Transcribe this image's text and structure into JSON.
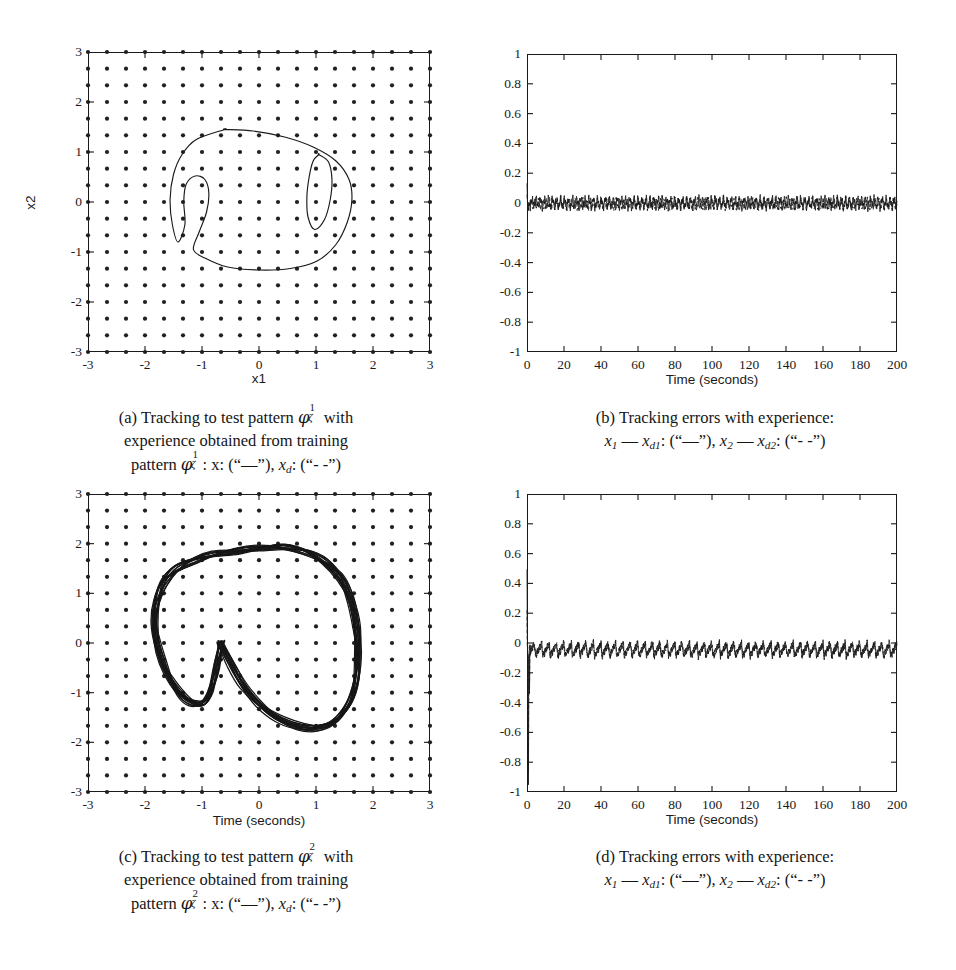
{
  "panels": [
    {
      "id": "a",
      "tag": "(a)",
      "caption_lines": [
        "(a) Tracking to test pattern φ¹_ζ with",
        "experience obtained from training",
        "pattern φ¹_ζ: x: (“—”), x_d: (“- -”)"
      ],
      "caption_plain": "(a) Tracking to test pattern φζ¹ with experience obtained from training pattern φζ¹: x: (“—”), xd: (“- -”)",
      "xlabel": "x1",
      "ylabel": "x2",
      "xticks": [
        "-3",
        "-2",
        "-1",
        "0",
        "1",
        "2",
        "3"
      ],
      "yticks": [
        "3",
        "2",
        "1",
        "0",
        "-1",
        "-2",
        "-3"
      ]
    },
    {
      "id": "b",
      "tag": "(b)",
      "caption_plain": "(b) Tracking errors with experience: x1 — xd1: (“—”), x2 — xd2: (“- -”)",
      "xlabel": "Time (seconds)",
      "ylabel": "",
      "xticks": [
        "0",
        "20",
        "40",
        "60",
        "80",
        "100",
        "120",
        "140",
        "160",
        "180",
        "200"
      ],
      "yticks": [
        "1",
        "0.8",
        "0.6",
        "0.4",
        "0.2",
        "0",
        "-0.2",
        "-0.4",
        "-0.6",
        "-0.8",
        "-1"
      ]
    },
    {
      "id": "c",
      "tag": "(c)",
      "caption_plain": "(c) Tracking to test pattern φζ² with experience obtained from training pattern φζ²: x: (“—”), xd: (“- -”)",
      "xlabel": "Time (seconds)",
      "ylabel": "",
      "xticks": [
        "-3",
        "-2",
        "-1",
        "0",
        "1",
        "2",
        "3"
      ],
      "yticks": [
        "3",
        "2",
        "1",
        "0",
        "-1",
        "-2",
        "-3"
      ]
    },
    {
      "id": "d",
      "tag": "(d)",
      "caption_plain": "(d) Tracking errors with experience: x1 — xd1: (“—”), x2 — xd2: (“- -”)",
      "xlabel": "Time (seconds)",
      "ylabel": "",
      "xticks": [
        "0",
        "20",
        "40",
        "60",
        "80",
        "100",
        "120",
        "140",
        "160",
        "180",
        "200"
      ],
      "yticks": [
        "1",
        "0.8",
        "0.6",
        "0.4",
        "0.2",
        "0",
        "-0.2",
        "-0.4",
        "-0.6",
        "-0.8",
        "-1"
      ]
    }
  ],
  "caption_text": {
    "a_l1_pre": "(a) Tracking to test pattern ",
    "a_l1_post": " with",
    "a_l2": "experience obtained from training",
    "a_l3_pre": "pattern ",
    "b_l1": "(b) Tracking errors with experience:",
    "c_l1_pre": "(c) Tracking to test pattern ",
    "c_l1_post": " with",
    "c_l2": "experience obtained from training",
    "c_l3_pre": "pattern ",
    "d_l1": "(d) Tracking errors with experience:",
    "phi": "φ",
    "zeta": "ζ",
    "sup1": "1",
    "sup2": "2",
    "colon_x": ": x: (“",
    "solid_glyph": "—",
    "close_quote": "”), ",
    "xd": "x",
    "d_sub": "d",
    "colon2": ": (“",
    "dashed_glyph": "- -",
    "final_close": "”)",
    "err_x": "x",
    "err_sub1": "1",
    "err_sub2": "2",
    "err_minus": "—",
    "err_xd": "x",
    "err_d1": "d1",
    "err_d2": "d2"
  },
  "chart_data": [
    {
      "id": "a",
      "type": "line",
      "title": "",
      "xlabel": "x1",
      "ylabel": "x2",
      "xlim": [
        -3,
        3
      ],
      "ylim": [
        -3,
        3
      ],
      "xticks": [
        -3,
        -2,
        -1,
        0,
        1,
        2,
        3
      ],
      "yticks": [
        -3,
        -2,
        -1,
        0,
        1,
        2,
        3
      ],
      "grid": "dot-lattice",
      "grid_note": "19x19 lattice of filled black dots covering the full axes box, spacing 1/3 unit",
      "series": [
        {
          "name": "x (“—”) actual state trajectory",
          "style": "solid",
          "closed": true,
          "points": [
            [
              -0.6,
              1.45
            ],
            [
              -0.1,
              1.42
            ],
            [
              0.45,
              1.3
            ],
            [
              0.95,
              1.1
            ],
            [
              1.35,
              0.82
            ],
            [
              1.58,
              0.45
            ],
            [
              1.63,
              0.05
            ],
            [
              1.55,
              -0.4
            ],
            [
              1.35,
              -0.85
            ],
            [
              1.02,
              -1.18
            ],
            [
              0.55,
              -1.33
            ],
            [
              0.0,
              -1.36
            ],
            [
              -0.55,
              -1.3
            ],
            [
              -0.95,
              -1.12
            ],
            [
              -1.15,
              -0.95
            ],
            [
              -1.05,
              -0.6
            ],
            [
              -0.92,
              -0.2
            ],
            [
              -0.88,
              0.18
            ],
            [
              -0.95,
              0.45
            ],
            [
              -1.12,
              0.52
            ],
            [
              -1.28,
              0.35
            ],
            [
              -1.32,
              0.0
            ],
            [
              -1.3,
              -0.45
            ],
            [
              -1.42,
              -0.8
            ],
            [
              -1.52,
              -0.45
            ],
            [
              -1.56,
              0.05
            ],
            [
              -1.5,
              0.55
            ],
            [
              -1.35,
              0.95
            ],
            [
              -1.1,
              1.25
            ],
            [
              -0.6,
              1.45
            ]
          ]
        },
        {
          "name": "inner loop right (part of same trajectory)",
          "style": "solid",
          "closed": true,
          "points": [
            [
              1.05,
              0.95
            ],
            [
              1.22,
              0.8
            ],
            [
              1.28,
              0.45
            ],
            [
              1.25,
              0.05
            ],
            [
              1.15,
              -0.35
            ],
            [
              0.98,
              -0.55
            ],
            [
              0.86,
              -0.3
            ],
            [
              0.84,
              0.1
            ],
            [
              0.88,
              0.5
            ],
            [
              0.95,
              0.82
            ],
            [
              1.05,
              0.95
            ]
          ]
        }
      ]
    },
    {
      "id": "b",
      "type": "line",
      "title": "",
      "xlabel": "Time (seconds)",
      "ylabel": "",
      "xlim": [
        0,
        200
      ],
      "ylim": [
        -1,
        1
      ],
      "xticks": [
        0,
        20,
        40,
        60,
        80,
        100,
        120,
        140,
        160,
        180,
        200
      ],
      "yticks": [
        -1,
        -0.8,
        -0.6,
        -0.4,
        -0.2,
        0,
        0.2,
        0.4,
        0.6,
        0.8,
        1
      ],
      "grid": "off",
      "description": "Two overlapping near-zero tracking-error signals, small high-frequency ripple of amplitude ~0.03, plus a short initial transient at t=0 reaching about +0.12 / -0.05",
      "series": [
        {
          "name": "x1 − xd1 (“—”)",
          "style": "solid",
          "mean": 0.0,
          "ripple_amplitude": 0.03,
          "ripple_period": 2.2,
          "initial_transient": [
            0.12,
            -0.06
          ]
        },
        {
          "name": "x2 − xd2 (“- -”)",
          "style": "dashed",
          "mean": -0.005,
          "ripple_amplitude": 0.025,
          "ripple_period": 2.0,
          "initial_transient": [
            0.05,
            -0.05
          ]
        }
      ]
    },
    {
      "id": "c",
      "type": "line",
      "title": "",
      "xlabel": "Time (seconds)",
      "ylabel": "",
      "xlim": [
        -3,
        3
      ],
      "ylim": [
        -3,
        3
      ],
      "xticks": [
        -3,
        -2,
        -1,
        0,
        1,
        2,
        3
      ],
      "yticks": [
        -3,
        -2,
        -1,
        0,
        1,
        2,
        3
      ],
      "grid": "dot-lattice",
      "grid_note": "19x19 lattice of filled black dots covering the full axes box, spacing 1/3 unit",
      "series": [
        {
          "name": "x (“—”) heart-shaped limit cycle, several overlapping revolutions",
          "style": "solid",
          "closed": true,
          "points": [
            [
              -0.68,
              -0.05
            ],
            [
              -0.5,
              -0.45
            ],
            [
              -0.3,
              -0.85
            ],
            [
              0.0,
              -1.25
            ],
            [
              0.35,
              -1.55
            ],
            [
              0.72,
              -1.72
            ],
            [
              1.05,
              -1.72
            ],
            [
              1.35,
              -1.55
            ],
            [
              1.58,
              -1.2
            ],
            [
              1.7,
              -0.75
            ],
            [
              1.73,
              -0.25
            ],
            [
              1.7,
              0.3
            ],
            [
              1.6,
              0.85
            ],
            [
              1.42,
              1.3
            ],
            [
              1.15,
              1.62
            ],
            [
              0.8,
              1.83
            ],
            [
              0.4,
              1.92
            ],
            [
              0.0,
              1.9
            ],
            [
              -0.4,
              1.85
            ],
            [
              -0.8,
              1.78
            ],
            [
              -1.15,
              1.66
            ],
            [
              -1.45,
              1.48
            ],
            [
              -1.68,
              1.2
            ],
            [
              -1.8,
              0.82
            ],
            [
              -1.84,
              0.4
            ],
            [
              -1.8,
              -0.02
            ],
            [
              -1.7,
              -0.42
            ],
            [
              -1.55,
              -0.78
            ],
            [
              -1.38,
              -1.05
            ],
            [
              -1.18,
              -1.2
            ],
            [
              -1.0,
              -1.22
            ],
            [
              -0.88,
              -1.05
            ],
            [
              -0.8,
              -0.72
            ],
            [
              -0.74,
              -0.38
            ],
            [
              -0.68,
              -0.05
            ]
          ]
        },
        {
          "name": "xd (“- -”) desired trajectory (nearly coincident)",
          "style": "dashed",
          "closed": true,
          "points": [
            [
              -0.66,
              -0.02
            ],
            [
              -0.46,
              -0.42
            ],
            [
              -0.26,
              -0.82
            ],
            [
              0.04,
              -1.22
            ],
            [
              0.38,
              -1.52
            ],
            [
              0.75,
              -1.68
            ],
            [
              1.08,
              -1.68
            ],
            [
              1.37,
              -1.52
            ],
            [
              1.6,
              -1.17
            ],
            [
              1.72,
              -0.72
            ],
            [
              1.75,
              -0.22
            ],
            [
              1.72,
              0.32
            ],
            [
              1.62,
              0.88
            ],
            [
              1.44,
              1.32
            ],
            [
              1.17,
              1.64
            ],
            [
              0.82,
              1.85
            ],
            [
              0.42,
              1.94
            ],
            [
              0.02,
              1.92
            ],
            [
              -0.38,
              1.87
            ],
            [
              -0.78,
              1.8
            ],
            [
              -1.13,
              1.68
            ],
            [
              -1.43,
              1.5
            ],
            [
              -1.66,
              1.22
            ],
            [
              -1.78,
              0.84
            ],
            [
              -1.82,
              0.42
            ],
            [
              -1.78,
              0.0
            ],
            [
              -1.68,
              -0.4
            ],
            [
              -1.53,
              -0.76
            ],
            [
              -1.36,
              -1.03
            ],
            [
              -1.16,
              -1.18
            ],
            [
              -0.98,
              -1.2
            ],
            [
              -0.86,
              -1.03
            ],
            [
              -0.78,
              -0.7
            ],
            [
              -0.72,
              -0.36
            ],
            [
              -0.66,
              -0.02
            ]
          ]
        }
      ]
    },
    {
      "id": "d",
      "type": "line",
      "title": "",
      "xlabel": "Time (seconds)",
      "ylabel": "",
      "xlim": [
        0,
        200
      ],
      "ylim": [
        -1,
        1
      ],
      "xticks": [
        0,
        20,
        40,
        60,
        80,
        100,
        120,
        140,
        160,
        180,
        200
      ],
      "yticks": [
        -1,
        -0.8,
        -0.6,
        -0.4,
        -0.2,
        0,
        0.2,
        0.4,
        0.6,
        0.8,
        1
      ],
      "grid": "off",
      "description": "Two overlapping near-zero tracking-error signals with periodic sawtooth dips of about -0.09 every ~4 s; large initial transient at t=0 spanning roughly +0.45 down to -1",
      "series": [
        {
          "name": "x1 − xd1 (“—”)",
          "style": "solid",
          "mean": 0.0,
          "ripple_amplitude": 0.05,
          "ripple_period": 4.0,
          "initial_transient": [
            0.45,
            -1.0
          ]
        },
        {
          "name": "x2 − xd2 (“- -”)",
          "style": "dashed",
          "mean": -0.01,
          "ripple_amplitude": 0.04,
          "ripple_period": 4.0,
          "initial_transient": [
            0.2,
            -0.9
          ]
        }
      ]
    }
  ]
}
